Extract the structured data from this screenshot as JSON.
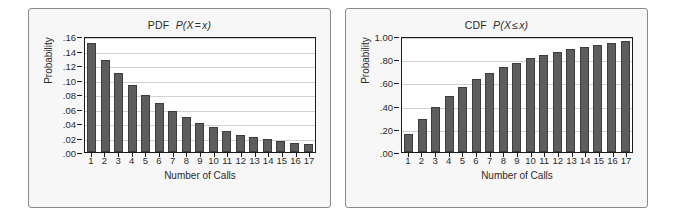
{
  "figure": {
    "background": "#ffffff",
    "panel_background": "#f7f7f7",
    "bar_color": "#5d5d5d",
    "bar_border_color": "#3d3d3d",
    "grid_color": "#d2d2d2",
    "axis_color": "#1a1a1a"
  },
  "chart_data": [
    {
      "type": "bar",
      "id": "pdf",
      "title": "PDF  P(X = x)",
      "title_prefix": "PDF",
      "title_math_lead": "P(X",
      "title_math_op": "=",
      "title_math_tail": "x)",
      "xlabel": "Number of Calls",
      "ylabel": "Probability",
      "categories": [
        1,
        2,
        3,
        4,
        5,
        6,
        7,
        8,
        9,
        10,
        11,
        12,
        13,
        14,
        15,
        16,
        17
      ],
      "values": [
        0.15,
        0.127,
        0.109,
        0.092,
        0.078,
        0.067,
        0.057,
        0.048,
        0.04,
        0.034,
        0.029,
        0.024,
        0.021,
        0.018,
        0.015,
        0.013,
        0.011
      ],
      "ylim": [
        0.0,
        0.16
      ],
      "ytick_values": [
        0.0,
        0.02,
        0.04,
        0.06,
        0.08,
        0.1,
        0.12,
        0.14,
        0.16
      ],
      "ytick_labels": [
        ".00",
        ".02",
        ".04",
        ".06",
        ".08",
        ".10",
        ".12",
        ".14",
        ".16"
      ],
      "grid": true,
      "legend": "none"
    },
    {
      "type": "bar",
      "id": "cdf",
      "title": "CDF  P(X ≤ x)",
      "title_prefix": "CDF",
      "title_math_lead": "P(X",
      "title_math_op": "≤",
      "title_math_tail": "x)",
      "xlabel": "Number of Calls",
      "ylabel": "Probability",
      "categories": [
        1,
        2,
        3,
        4,
        5,
        6,
        7,
        8,
        9,
        10,
        11,
        12,
        13,
        14,
        15,
        16,
        17
      ],
      "values": [
        0.155,
        0.283,
        0.392,
        0.484,
        0.561,
        0.628,
        0.677,
        0.735,
        0.765,
        0.81,
        0.836,
        0.86,
        0.888,
        0.908,
        0.919,
        0.937,
        0.955
      ],
      "ylim": [
        0.0,
        1.0
      ],
      "ytick_values": [
        0.0,
        0.2,
        0.4,
        0.6,
        0.8,
        1.0
      ],
      "ytick_labels": [
        ".00",
        ".20",
        ".40",
        ".60",
        ".80",
        "1.00"
      ],
      "grid": true,
      "legend": "none"
    }
  ]
}
